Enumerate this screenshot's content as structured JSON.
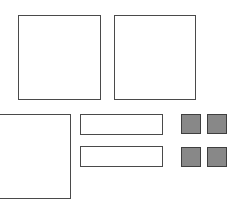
{
  "shapes": {
    "large_squares": [
      {
        "id": "top-left-square",
        "x": 18,
        "y": 15,
        "w": 83,
        "h": 85
      },
      {
        "id": "top-right-square",
        "x": 114,
        "y": 15,
        "w": 82,
        "h": 85
      },
      {
        "id": "bottom-left-square",
        "x": -2,
        "y": 114,
        "w": 73,
        "h": 85
      }
    ],
    "bars": [
      {
        "id": "bar-top",
        "x": 80,
        "y": 114,
        "w": 83,
        "h": 21
      },
      {
        "id": "bar-bottom",
        "x": 80,
        "y": 146,
        "w": 83,
        "h": 21
      }
    ],
    "tiles": [
      {
        "id": "tile-1",
        "x": 181,
        "y": 114,
        "w": 20,
        "h": 20
      },
      {
        "id": "tile-2",
        "x": 207,
        "y": 114,
        "w": 20,
        "h": 20
      },
      {
        "id": "tile-3",
        "x": 181,
        "y": 147,
        "w": 20,
        "h": 20
      },
      {
        "id": "tile-4",
        "x": 207,
        "y": 147,
        "w": 20,
        "h": 20
      }
    ]
  },
  "colors": {
    "outline": "#4a4a4a",
    "tile_fill": "#888888",
    "background": "#ffffff"
  }
}
